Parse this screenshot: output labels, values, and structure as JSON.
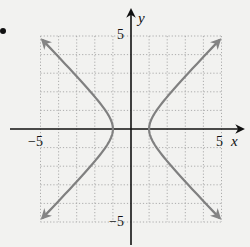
{
  "chart_data": {
    "type": "line",
    "title": "",
    "equation_implied": "x^2 - y^2 = 1",
    "xlabel": "x",
    "ylabel": "y",
    "xlim": [
      -5,
      5
    ],
    "ylim": [
      -5,
      5
    ],
    "grid": true,
    "grid_style": "dotted",
    "tick_labels": {
      "x": [
        "-5",
        "5"
      ],
      "y": [
        "5",
        "-5"
      ]
    },
    "series": [
      {
        "name": "right branch",
        "color": "#808080",
        "x": [
          4.9,
          3.2,
          2.0,
          1.4,
          1.0,
          1.4,
          2.0,
          3.2,
          4.9
        ],
        "y": [
          4.8,
          3.04,
          1.73,
          0.98,
          0,
          -0.98,
          -1.73,
          -3.04,
          -4.8
        ],
        "arrows": "both ends"
      },
      {
        "name": "left branch",
        "color": "#808080",
        "x": [
          -4.9,
          -3.2,
          -2.0,
          -1.4,
          -1.0,
          -1.4,
          -2.0,
          -3.2,
          -4.9
        ],
        "y": [
          4.8,
          3.04,
          1.73,
          0.98,
          0,
          -0.98,
          -1.73,
          -3.04,
          -4.8
        ],
        "arrows": "both ends"
      }
    ],
    "legend": null
  },
  "labels": {
    "x_axis": "x",
    "y_axis": "y",
    "x_min": "−5",
    "x_max": "5",
    "y_max": "5",
    "y_min": "−5"
  }
}
